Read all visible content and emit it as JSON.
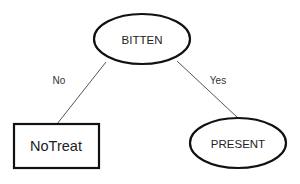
{
  "diagram": {
    "type": "decision-tree",
    "nodes": [
      {
        "id": "bitten",
        "label": "BITTEN",
        "shape": "ellipse",
        "cx": 142,
        "cy": 39,
        "rx": 48,
        "ry": 25
      },
      {
        "id": "notreat",
        "label": "NoTreat",
        "shape": "rectangle",
        "x": 14,
        "y": 124,
        "width": 85,
        "height": 44
      },
      {
        "id": "present",
        "label": "PRESENT",
        "shape": "ellipse",
        "cx": 238,
        "cy": 143,
        "rx": 48,
        "ry": 25
      }
    ],
    "edges": [
      {
        "from": "bitten",
        "to": "notreat",
        "label": "No",
        "x1": 106,
        "y1": 62,
        "x2": 57,
        "y2": 124,
        "label_x": 59,
        "label_y": 80
      },
      {
        "from": "bitten",
        "to": "present",
        "label": "Yes",
        "x1": 177,
        "y1": 61,
        "x2": 238,
        "y2": 118,
        "label_x": 218,
        "label_y": 80
      }
    ]
  }
}
